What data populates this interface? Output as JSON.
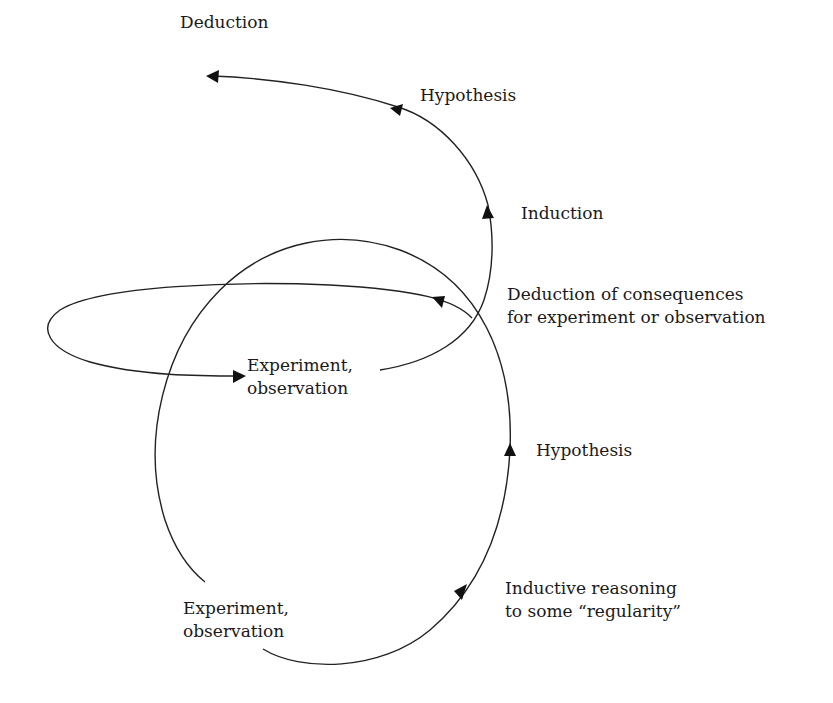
{
  "diagram": {
    "type": "scientific-method-spiral",
    "labels": {
      "top_deduction": "Deduction",
      "top_hypothesis": "Hypothesis",
      "induction": "Induction",
      "deduction_consequences_line1": "Deduction of consequences",
      "deduction_consequences_line2": "for experiment or observation",
      "experiment_upper_line1": "Experiment,",
      "experiment_upper_line2": "observation",
      "hypothesis_lower": "Hypothesis",
      "inductive_line1": "Inductive reasoning",
      "inductive_line2": "to some “regularity”",
      "experiment_lower_line1": "Experiment,",
      "experiment_lower_line2": "observation"
    },
    "flow": [
      "Experiment, observation",
      "Inductive reasoning to some “regularity”",
      "Hypothesis",
      "Deduction of consequences for experiment or observation",
      "Experiment, observation",
      "Induction",
      "Hypothesis",
      "Deduction"
    ],
    "colors": {
      "stroke": "#222222",
      "text": "#1a1a1a",
      "background": "#ffffff"
    }
  }
}
